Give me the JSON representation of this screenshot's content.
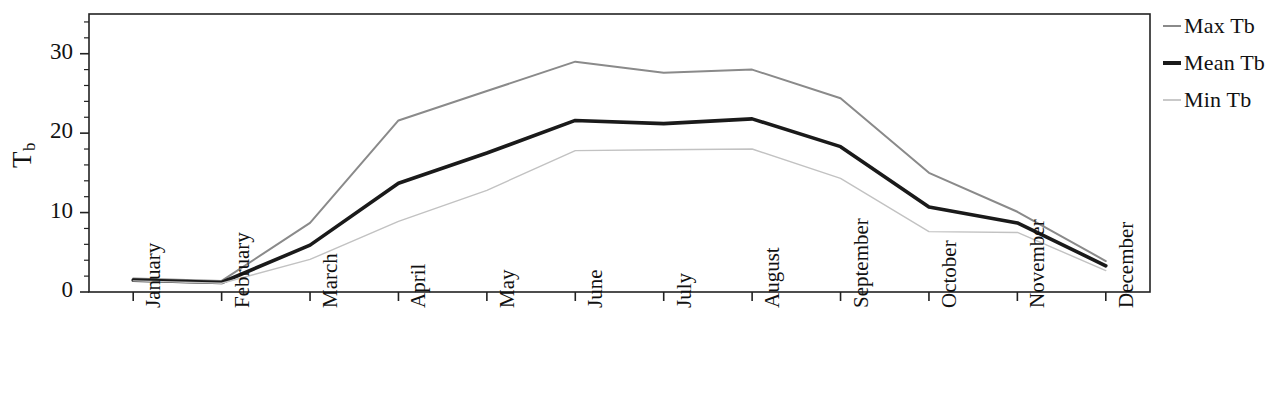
{
  "chart_data": {
    "type": "line",
    "title": "",
    "subtitle": "",
    "xlabel": "",
    "ylabel": "Tb",
    "ylabel_base": "T",
    "ylabel_sub": "b",
    "categories": [
      "January",
      "February",
      "March",
      "April",
      "May",
      "June",
      "July",
      "August",
      "September",
      "October",
      "November",
      "December"
    ],
    "series": [
      {
        "name": "Max Tb",
        "color": "#8a8a8a",
        "width": 2.0,
        "values": [
          1.7,
          1.4,
          8.7,
          21.6,
          25.3,
          29.0,
          27.6,
          28.0,
          24.4,
          15.0,
          10.1,
          3.9
        ]
      },
      {
        "name": "Mean Tb",
        "color": "#1a1a1a",
        "width": 3.6,
        "values": [
          1.5,
          1.2,
          5.9,
          13.7,
          17.5,
          21.6,
          21.2,
          21.8,
          18.3,
          10.7,
          8.7,
          3.3
        ]
      },
      {
        "name": "Min Tb",
        "color": "#c2c2c2",
        "width": 1.4,
        "values": [
          1.4,
          1.1,
          4.1,
          8.9,
          12.8,
          17.8,
          17.9,
          18.0,
          14.3,
          7.6,
          7.5,
          2.7
        ]
      }
    ],
    "ylim": [
      0,
      35
    ],
    "yticks": [
      0,
      10,
      20,
      30
    ],
    "ytick_labels": [
      "0",
      "10",
      "20",
      "30"
    ],
    "yminor_step": 2,
    "grid": false,
    "legend_position": "right",
    "axis_color": "#222222",
    "frame": true
  },
  "legend": {
    "items": [
      {
        "label": "Max Tb",
        "color": "#8a8a8a",
        "thickness": 2
      },
      {
        "label": "Mean Tb",
        "color": "#1a1a1a",
        "thickness": 4
      },
      {
        "label": "Min Tb",
        "color": "#c9c9c9",
        "thickness": 2
      }
    ]
  }
}
